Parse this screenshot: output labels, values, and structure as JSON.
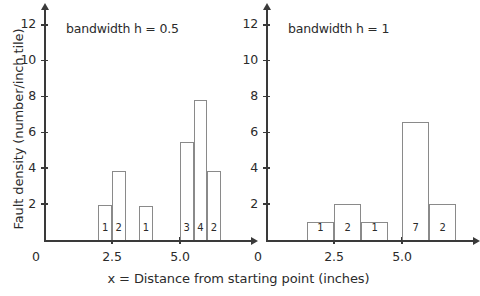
{
  "figure": {
    "xlabel": "x = Distance from starting point (inches)",
    "ylabel": "Fault density (number/inch tile)",
    "origin_label": "0",
    "axis_color": "#3a3a3a",
    "bar_edge_color": "#8a8a8a",
    "background": "#ffffff"
  },
  "chart_data": [
    {
      "type": "bar",
      "title": "bandwidth h = 0.5",
      "xlabel": "x = Distance from starting point (inches)",
      "ylabel": "Fault density (number/inch tile)",
      "xlim": [
        0,
        7.6
      ],
      "ylim": [
        0,
        12.6
      ],
      "grid": false,
      "legend": null,
      "ytick_labels": [
        "2",
        "4",
        "6",
        "8",
        "10",
        "12"
      ],
      "ytick_values": [
        2,
        4,
        6,
        8,
        10,
        12
      ],
      "xtick_labels": [
        "2.5",
        "5.0"
      ],
      "xtick_values": [
        2.5,
        5.0
      ],
      "bin_width": 0.5,
      "bars": [
        {
          "x0": 2.0,
          "x1": 2.5,
          "height": 1.95,
          "count_label": "1"
        },
        {
          "x0": 2.5,
          "x1": 3.0,
          "height": 3.85,
          "count_label": "2"
        },
        {
          "x0": 3.5,
          "x1": 4.0,
          "height": 1.92,
          "count_label": "1"
        },
        {
          "x0": 5.0,
          "x1": 5.5,
          "height": 5.45,
          "count_label": "3"
        },
        {
          "x0": 5.5,
          "x1": 6.0,
          "height": 7.8,
          "count_label": "4"
        },
        {
          "x0": 6.0,
          "x1": 6.5,
          "height": 3.85,
          "count_label": "2"
        }
      ]
    },
    {
      "type": "bar",
      "title": "bandwidth h = 1",
      "xlabel": "x = Distance from starting point (inches)",
      "ylabel": "Fault density (number/inch tile)",
      "xlim": [
        0,
        7.6
      ],
      "ylim": [
        0,
        12.6
      ],
      "grid": false,
      "legend": null,
      "ytick_labels": [
        "2",
        "4",
        "6",
        "8",
        "10",
        "12"
      ],
      "ytick_values": [
        2,
        4,
        6,
        8,
        10,
        12
      ],
      "xtick_labels": [
        "2.5",
        "5.0"
      ],
      "xtick_values": [
        2.5,
        5.0
      ],
      "bin_width": 1.0,
      "bars": [
        {
          "x0": 1.5,
          "x1": 2.5,
          "height": 1.0,
          "count_label": "1"
        },
        {
          "x0": 2.5,
          "x1": 3.5,
          "height": 2.0,
          "count_label": "2"
        },
        {
          "x0": 3.5,
          "x1": 4.5,
          "height": 1.0,
          "count_label": "1"
        },
        {
          "x0": 5.0,
          "x1": 6.0,
          "height": 6.6,
          "count_label": "7"
        },
        {
          "x0": 6.0,
          "x1": 7.0,
          "height": 2.0,
          "count_label": "2"
        }
      ]
    }
  ]
}
